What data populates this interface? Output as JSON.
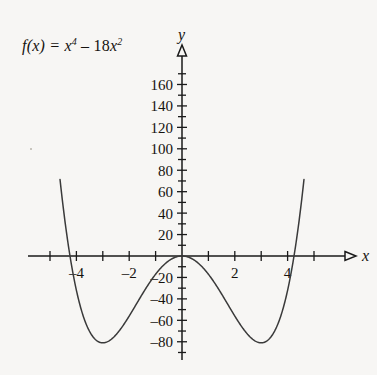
{
  "figure": {
    "background_color": "#f7f6f4",
    "ink_color": "#15120f",
    "curve_color": "#3a3a3a",
    "function_label": {
      "lhs": "f(x) = ",
      "term1_base": "x",
      "term1_exp": "4",
      "operator": " – ",
      "term2_coefficient": "18",
      "term2_base": "x",
      "term2_exp": "2"
    },
    "x_axis_name": "x",
    "y_axis_name": "y"
  },
  "chart_data": {
    "type": "line",
    "xlabel": "x",
    "ylabel": "y",
    "xlim": [
      -5.2,
      5.2
    ],
    "ylim": [
      -95,
      185
    ],
    "grid": false,
    "legend": null,
    "x_ticks_major": [
      -4,
      -2,
      2,
      4
    ],
    "x_tick_labels": [
      "–4",
      "–2",
      "2",
      "4"
    ],
    "x_ticks_minor": [
      -5,
      -3,
      -1,
      1,
      3,
      5
    ],
    "y_ticks": [
      -80,
      -60,
      -40,
      -20,
      20,
      40,
      60,
      80,
      100,
      120,
      140,
      160
    ],
    "y_tick_labels": [
      "–80",
      "–60",
      "–40",
      "–20",
      "20",
      "40",
      "60",
      "80",
      "100",
      "120",
      "140",
      "160"
    ],
    "y_ticks_minor": [
      -90,
      -70,
      -50,
      -30,
      -10,
      10,
      30,
      50,
      70,
      90,
      110,
      130,
      150,
      170
    ],
    "series": [
      {
        "name": "f(x) = x^4 - 18x^2",
        "equation": "y = x^4 - 18*x^2",
        "x": [
          -4.55,
          -4.4,
          -4.24,
          -4.0,
          -3.75,
          -3.5,
          -3.25,
          -3.0,
          -2.75,
          -2.5,
          -2.25,
          -2.0,
          -1.75,
          -1.5,
          -1.25,
          -1.0,
          -0.75,
          -0.5,
          -0.25,
          0,
          0.25,
          0.5,
          0.75,
          1.0,
          1.25,
          1.5,
          1.75,
          2.0,
          2.25,
          2.5,
          2.75,
          3.0,
          3.25,
          3.5,
          3.75,
          4.0,
          4.24,
          4.4,
          4.55
        ],
        "y": [
          56.0,
          26.4,
          0.0,
          -32.0,
          -55.5,
          -70.4,
          -78.5,
          -81.0,
          -79.0,
          -73.4,
          -65.5,
          -56.0,
          -45.8,
          -35.4,
          -25.7,
          -17.0,
          -9.8,
          -4.4,
          -1.1,
          0,
          -1.1,
          -4.4,
          -9.8,
          -17.0,
          -25.7,
          -35.4,
          -45.8,
          -56.0,
          -65.5,
          -73.4,
          -79.0,
          -81.0,
          -78.5,
          -70.4,
          -55.5,
          -32.0,
          0.0,
          26.4,
          56.0
        ]
      }
    ],
    "annotations": [
      {
        "kind": "minimum",
        "x": -3,
        "y": -81
      },
      {
        "kind": "minimum",
        "x": 3,
        "y": -81
      },
      {
        "kind": "root",
        "x": -4.2426,
        "y": 0
      },
      {
        "kind": "root",
        "x": 0,
        "y": 0
      },
      {
        "kind": "root",
        "x": 4.2426,
        "y": 0
      }
    ]
  }
}
